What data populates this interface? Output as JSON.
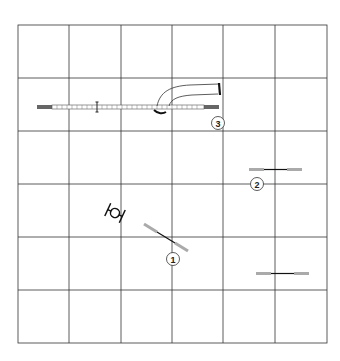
{
  "diagram": {
    "type": "agility course map",
    "grid": {
      "columns": 6,
      "rows": 6,
      "x_lines": [
        18,
        69,
        121,
        172,
        223,
        275,
        327
      ],
      "y_lines": [
        25,
        78,
        131,
        184,
        237,
        290,
        343
      ],
      "line_color": "#333333"
    },
    "obstacles": [
      {
        "id": "dogwalk",
        "kind": "dogwalk",
        "number": ""
      },
      {
        "id": "tunnel",
        "kind": "tunnel",
        "number": ""
      },
      {
        "id": "tire",
        "kind": "tire",
        "number": ""
      },
      {
        "id": "jump-1",
        "kind": "jump",
        "number": "1"
      },
      {
        "id": "jump-2",
        "kind": "jump",
        "number": "2"
      },
      {
        "id": "dogwalk-3",
        "kind": "dogwalk",
        "number": "3"
      },
      {
        "id": "jump-unnumbered",
        "kind": "jump",
        "number": ""
      }
    ],
    "labels": {
      "n1": "1",
      "n2": "2",
      "n3": "3"
    },
    "colors": {
      "contact": "#666666",
      "wing": "#aaaaaa",
      "bar": "#111111"
    }
  }
}
